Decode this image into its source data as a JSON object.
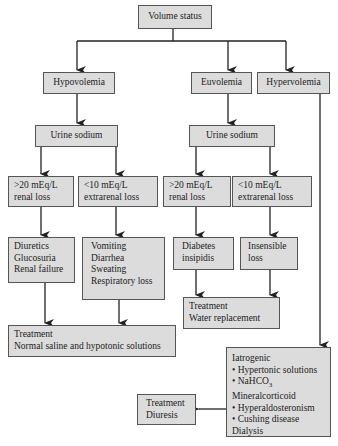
{
  "diagram": {
    "root": {
      "label": "Volume status"
    },
    "level1": [
      {
        "id": "hypovolemia",
        "label": "Hypovolemia"
      },
      {
        "id": "euvolemia",
        "label": "Euvolemia"
      },
      {
        "id": "hypervolemia",
        "label": "Hypervolemia"
      }
    ],
    "hypovolemia_branch": {
      "test": "Urine sodium",
      "renal": {
        "lines": [
          ">20 mEq/L",
          "renal loss"
        ]
      },
      "extrarenal": {
        "lines": [
          "<10 mEq/L",
          "extrarenal loss"
        ]
      },
      "renal_causes": {
        "lines": [
          "Diuretics",
          "Glucosuria",
          "Renal failure"
        ]
      },
      "extrarenal_causes": {
        "lines": [
          "Vomiting",
          "Diarrhea",
          "Sweating",
          "Respiratory loss"
        ]
      },
      "treatment": {
        "lines": [
          "Treatment",
          "Normal saline and hypotonic solutions"
        ]
      }
    },
    "euvolemia_branch": {
      "test": "Urine sodium",
      "renal": {
        "lines": [
          ">20 mEq/L",
          "renal loss"
        ]
      },
      "extrarenal": {
        "lines": [
          "<10 mEq/L",
          "extrarenal loss"
        ]
      },
      "renal_causes": {
        "lines": [
          "Diabetes",
          "insipidis"
        ]
      },
      "extrarenal_causes": {
        "lines": [
          "Insensible",
          "loss"
        ]
      },
      "treatment": {
        "lines": [
          "Treatment",
          "Water replacement"
        ]
      }
    },
    "hypervolemia_branch": {
      "causes": {
        "iatrogenic": "Iatrogenic",
        "iatrogenic_items": [
          "Hypertonic solutions",
          "NaHCO"
        ],
        "nahco_subscript": "3",
        "mineralocorticoid": "Mineralcorticoid",
        "mineralocorticoid_items": [
          "Hyperaldosteronism",
          "Cushing disease"
        ],
        "dialysis": "Dialysis"
      },
      "treatment": {
        "lines": [
          "Treatment",
          "Diuresis"
        ]
      }
    },
    "colors": {
      "box_fill": "#dcdcdc",
      "box_border": "#555555",
      "line": "#222222"
    }
  }
}
